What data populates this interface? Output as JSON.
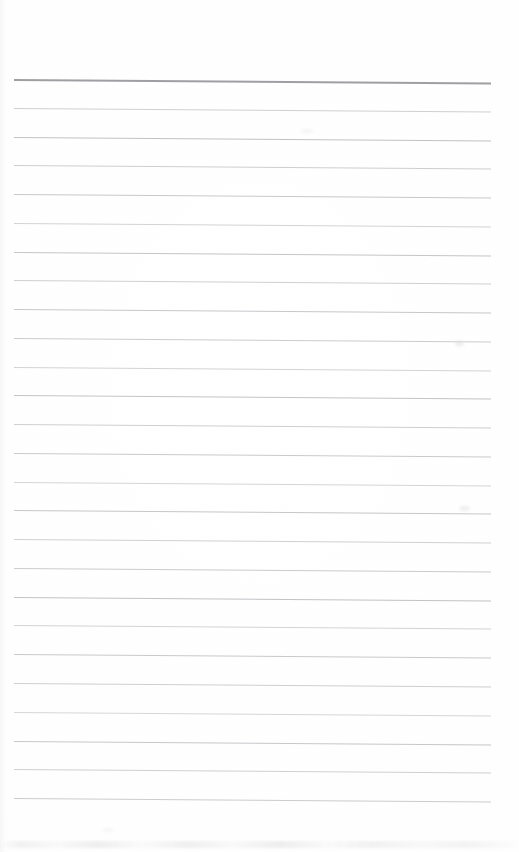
{
  "document": {
    "kind": "blank-ruled-page-scan",
    "title": "Blank Ruled Notepad Page",
    "width": 519,
    "height": 852,
    "background_color": "#fefefe",
    "text_content": "",
    "has_visible_text": false,
    "has_margin_rule": false,
    "has_punch_holes": false
  },
  "rule_area": {
    "left": 14,
    "right": 491,
    "width": 477,
    "first_line_y": 79,
    "last_line_y": 798,
    "line_spacing": 28.76,
    "line_count": 26,
    "skew_degrees": 0.42
  },
  "styles": {
    "header_rule_color": "#9a9a9e",
    "header_rule_thickness": 2,
    "body_rule_color": "#c9c9cd",
    "body_rule_thickness": 1,
    "paper_color": "#fefefe",
    "noise_color": "#d6d6da"
  },
  "lines": [
    {
      "index": 1,
      "y": 79.0,
      "role": "header-rule",
      "color": "#9a9a9e",
      "thickness": 2,
      "opacity": 0.95,
      "left": 14,
      "right": 491
    },
    {
      "index": 2,
      "y": 107.8,
      "role": "body-rule",
      "color": "#c9c9cd",
      "thickness": 1,
      "opacity": 0.88,
      "left": 14,
      "right": 491
    },
    {
      "index": 3,
      "y": 136.5,
      "role": "body-rule",
      "color": "#bcbcc1",
      "thickness": 1.2,
      "opacity": 0.92,
      "left": 14,
      "right": 491
    },
    {
      "index": 4,
      "y": 165.3,
      "role": "body-rule",
      "color": "#c6c6ca",
      "thickness": 1,
      "opacity": 0.86,
      "left": 14,
      "right": 491
    },
    {
      "index": 5,
      "y": 194.0,
      "role": "body-rule",
      "color": "#c2c2c7",
      "thickness": 1,
      "opacity": 0.9,
      "left": 14,
      "right": 491
    },
    {
      "index": 6,
      "y": 222.8,
      "role": "body-rule",
      "color": "#cbcbcf",
      "thickness": 1,
      "opacity": 0.84,
      "left": 14,
      "right": 491
    },
    {
      "index": 7,
      "y": 251.6,
      "role": "body-rule",
      "color": "#bfbfc4",
      "thickness": 1.1,
      "opacity": 0.9,
      "left": 14,
      "right": 491
    },
    {
      "index": 8,
      "y": 280.3,
      "role": "body-rule",
      "color": "#c8c8cc",
      "thickness": 1,
      "opacity": 0.86,
      "left": 14,
      "right": 491
    },
    {
      "index": 9,
      "y": 309.1,
      "role": "body-rule",
      "color": "#c1c1c6",
      "thickness": 1,
      "opacity": 0.9,
      "left": 14,
      "right": 491
    },
    {
      "index": 10,
      "y": 337.8,
      "role": "body-rule",
      "color": "#c5c5ca",
      "thickness": 1,
      "opacity": 0.88,
      "left": 14,
      "right": 491
    },
    {
      "index": 11,
      "y": 366.6,
      "role": "body-rule",
      "color": "#cacace",
      "thickness": 1,
      "opacity": 0.84,
      "left": 14,
      "right": 491
    },
    {
      "index": 12,
      "y": 395.4,
      "role": "body-rule",
      "color": "#bebec3",
      "thickness": 1.1,
      "opacity": 0.91,
      "left": 14,
      "right": 491
    },
    {
      "index": 13,
      "y": 424.1,
      "role": "body-rule",
      "color": "#c7c7cb",
      "thickness": 1,
      "opacity": 0.86,
      "left": 14,
      "right": 491
    },
    {
      "index": 14,
      "y": 452.9,
      "role": "body-rule",
      "color": "#c3c3c8",
      "thickness": 1,
      "opacity": 0.89,
      "left": 14,
      "right": 491
    },
    {
      "index": 15,
      "y": 481.6,
      "role": "body-rule",
      "color": "#ccccd0",
      "thickness": 1,
      "opacity": 0.82,
      "left": 14,
      "right": 491
    },
    {
      "index": 16,
      "y": 510.4,
      "role": "body-rule",
      "color": "#c0c0c5",
      "thickness": 1,
      "opacity": 0.9,
      "left": 14,
      "right": 491
    },
    {
      "index": 17,
      "y": 539.2,
      "role": "body-rule",
      "color": "#c9c9cd",
      "thickness": 1,
      "opacity": 0.85,
      "left": 14,
      "right": 491
    },
    {
      "index": 18,
      "y": 567.9,
      "role": "body-rule",
      "color": "#c4c4c9",
      "thickness": 1,
      "opacity": 0.88,
      "left": 14,
      "right": 491
    },
    {
      "index": 19,
      "y": 596.7,
      "role": "body-rule",
      "color": "#bdbdc2",
      "thickness": 1.1,
      "opacity": 0.92,
      "left": 14,
      "right": 491
    },
    {
      "index": 20,
      "y": 625.4,
      "role": "body-rule",
      "color": "#cacace",
      "thickness": 1,
      "opacity": 0.84,
      "left": 14,
      "right": 491
    },
    {
      "index": 21,
      "y": 654.2,
      "role": "body-rule",
      "color": "#c2c2c7",
      "thickness": 1,
      "opacity": 0.89,
      "left": 14,
      "right": 491
    },
    {
      "index": 22,
      "y": 682.9,
      "role": "body-rule",
      "color": "#c7c7cc",
      "thickness": 1,
      "opacity": 0.86,
      "left": 14,
      "right": 491
    },
    {
      "index": 23,
      "y": 711.7,
      "role": "body-rule",
      "color": "#cdcdd1",
      "thickness": 1,
      "opacity": 0.82,
      "left": 14,
      "right": 491
    },
    {
      "index": 24,
      "y": 740.5,
      "role": "body-rule",
      "color": "#c1c1c6",
      "thickness": 1,
      "opacity": 0.9,
      "left": 14,
      "right": 491
    },
    {
      "index": 25,
      "y": 769.2,
      "role": "body-rule",
      "color": "#c8c8cd",
      "thickness": 1,
      "opacity": 0.85,
      "left": 14,
      "right": 491
    },
    {
      "index": 26,
      "y": 798.0,
      "role": "body-rule",
      "color": "#c4c4c9",
      "thickness": 1,
      "opacity": 0.87,
      "left": 14,
      "right": 491
    }
  ],
  "artifacts": {
    "smudges": [
      {
        "x": 455,
        "y": 341,
        "w": 9,
        "h": 5,
        "color": "#dcdce0",
        "opacity": 0.55
      },
      {
        "x": 459,
        "y": 506,
        "w": 11,
        "h": 5,
        "color": "#dcdce0",
        "opacity": 0.48
      },
      {
        "x": 300,
        "y": 129,
        "w": 14,
        "h": 4,
        "color": "#e2e2e6",
        "opacity": 0.35
      },
      {
        "x": 103,
        "y": 828,
        "w": 10,
        "h": 4,
        "color": "#e2e2e6",
        "opacity": 0.3
      }
    ],
    "noise_band": {
      "y": 841,
      "height": 7
    }
  }
}
